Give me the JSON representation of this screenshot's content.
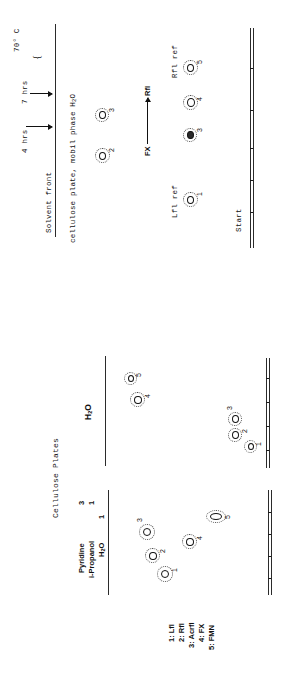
{
  "figure": {
    "top_panel": {
      "name": "tlc-timecourse-plate",
      "solvent_front_label": "Solvent front",
      "plate_label_a": "cellulose plate, mobil phase H",
      "plate_label_a_sub": "2",
      "plate_label_a_tail": "O",
      "time_labels": [
        "4 hrs",
        "7 hrs"
      ],
      "temperature": "70",
      "temperature_unit": "° C",
      "migration_axis": {
        "from_label": "FX",
        "to_label": "Rfl"
      },
      "reference_left_label": "Lfl ref",
      "reference_right_label": "Rfl ref",
      "start_label": "Start",
      "spots": [
        {
          "id": "1",
          "label": "1",
          "lane": "Lfl ref"
        },
        {
          "id": "2",
          "label": "2",
          "lane": "front-run"
        },
        {
          "id": "3",
          "label": "3",
          "lane": "front-run"
        },
        {
          "id": "3b",
          "label": "3",
          "lane": "mid"
        },
        {
          "id": "4",
          "label": "4",
          "lane": "mid"
        },
        {
          "id": "5",
          "label": "5",
          "lane": "Rfl ref"
        }
      ],
      "origin_ticks": 5
    },
    "bottom_panel": {
      "name": "cellulose-plates-comparison",
      "title": "Cellulose Plates",
      "system_a": {
        "lines": [
          {
            "solvent": "Pyridine",
            "parts": "3"
          },
          {
            "solvent": "i-Propanol",
            "parts": "1"
          },
          {
            "solvent": "H",
            "solvent_sub": "2",
            "solvent_tail": "O",
            "parts": "1"
          }
        ]
      },
      "system_b": {
        "solvent": "H",
        "solvent_sub": "2",
        "solvent_tail": "O"
      },
      "legend": [
        {
          "num": "1",
          "name": "Lfl"
        },
        {
          "num": "2",
          "name": "Rfl"
        },
        {
          "num": "3",
          "name": "Acrfl"
        },
        {
          "num": "4",
          "name": "FX"
        },
        {
          "num": "5",
          "name": "FMN"
        }
      ],
      "system_a_spots": [
        {
          "label": "1"
        },
        {
          "label": "2"
        },
        {
          "label": "3"
        },
        {
          "label": "4"
        },
        {
          "label": "5"
        }
      ],
      "system_b_spots": [
        {
          "label": "1"
        },
        {
          "label": "2"
        },
        {
          "label": "3"
        },
        {
          "label": "4"
        },
        {
          "label": "5"
        }
      ],
      "origin_ticks_a": 4,
      "origin_ticks_b": 4
    },
    "colors": {
      "ink": "#1a1a1a",
      "line": "#2b2b2b",
      "halo": "#4a4a4a",
      "paper": "#ffffff"
    }
  }
}
